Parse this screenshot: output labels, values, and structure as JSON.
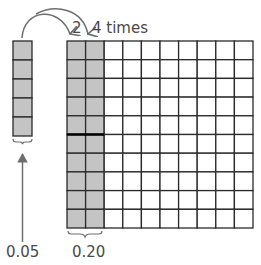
{
  "diagram": {
    "annotation": {
      "step_label": "2",
      "times_label": "4 times"
    },
    "left_strip": {
      "cells": 5,
      "value_label": "0.05"
    },
    "grid": {
      "rows": 10,
      "cols": 10,
      "shaded_cols": 2,
      "value_label": "0.20"
    },
    "colors": {
      "shade": "#c4c4c4",
      "line": "#2a2a2a",
      "arrow": "#6e6e6e",
      "text": "#4a4a4a"
    }
  }
}
